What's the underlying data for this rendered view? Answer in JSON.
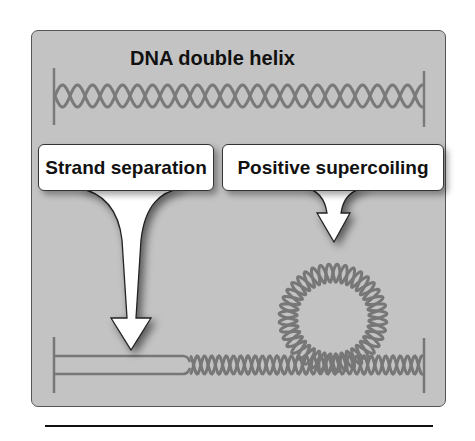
{
  "figure": {
    "title": "DNA double helix",
    "callouts": [
      {
        "label": "Strand separation"
      },
      {
        "label": "Positive supercoiling"
      }
    ],
    "colors": {
      "panel_bg": "#c3c3c3",
      "strand": "#6e6e6e",
      "callout_bg": "#ffffff",
      "rule": "#111111"
    }
  }
}
